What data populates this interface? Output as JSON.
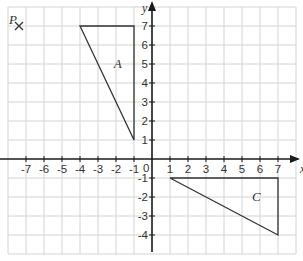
{
  "diagram": {
    "type": "coordinate-grid",
    "axes": {
      "x_label": "x",
      "y_label": "y",
      "origin_label": "0",
      "x_ticks": [
        "-7",
        "-6",
        "-5",
        "-4",
        "-3",
        "-2",
        "-1",
        "1",
        "2",
        "3",
        "4",
        "5",
        "6",
        "7"
      ],
      "y_ticks": [
        "7",
        "6",
        "5",
        "4",
        "3",
        "2",
        "1",
        "-1",
        "-2",
        "-3",
        "-4"
      ],
      "x_range": [
        -8,
        8
      ],
      "y_range": [
        -5,
        8
      ]
    },
    "point_P": {
      "label": "P",
      "x": -7,
      "y": 7,
      "marker": "cross"
    },
    "triangle_A": {
      "label": "A",
      "vertices": [
        [
          -4,
          7
        ],
        [
          -1,
          7
        ],
        [
          -1,
          1
        ]
      ]
    },
    "triangle_C": {
      "label": "C",
      "vertices": [
        [
          1,
          -1
        ],
        [
          7,
          -1
        ],
        [
          7,
          -4
        ]
      ]
    },
    "colors": {
      "grid": "#d4d4d4",
      "axis": "#1a1a1a",
      "shape": "#333333",
      "text": "#333333"
    }
  }
}
